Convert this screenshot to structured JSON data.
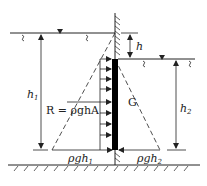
{
  "figure": {
    "type": "hydrostatic-gate-diagram",
    "labels": {
      "h": "h",
      "h1_base": "h",
      "h1_sub": "1",
      "h2_base": "h",
      "h2_sub": "2",
      "gate": "G",
      "resultant": "R = ρghA",
      "pressure_left_base": "ρgh",
      "pressure_left_sub": "1",
      "pressure_right_base": "ρgh",
      "pressure_right_sub": "2"
    },
    "colors": {
      "line": "#222222",
      "gate_fill": "#000000",
      "background": "#ffffff"
    },
    "geometry": {
      "wall_x": 115,
      "wall_top_y": 13,
      "ground_y": 165,
      "left_surface_y": 33,
      "right_surface_y": 59,
      "gate_top_y": 59,
      "gate_bottom_y": 150
    }
  }
}
